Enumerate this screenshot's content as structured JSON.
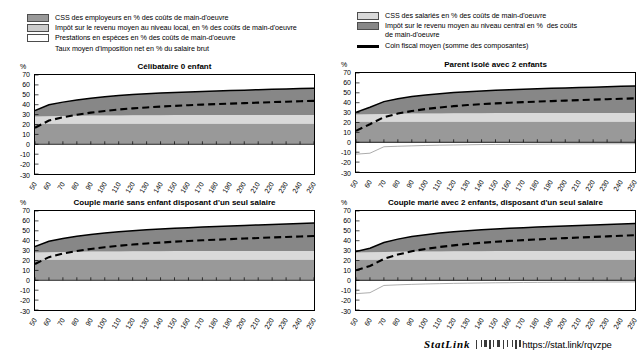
{
  "legend_left": {
    "items": [
      {
        "marker": "swatch",
        "color": "#999999",
        "label": "CSS des employeurs en % des coûts de main-d'oeuvre"
      },
      {
        "marker": "swatch",
        "color": "#cccccc",
        "label": "Impôt sur le revenu moyen au niveau local, en % des coûts de main-d'oeuvre"
      },
      {
        "marker": "swatch",
        "color": "#ffffff",
        "label": "Prestations en espèces en % des coûts de main-d'oeuvre"
      },
      {
        "marker": "dashed-line",
        "color": "#000000",
        "label": "Taux moyen d'imposition net en % du salaire brut"
      }
    ]
  },
  "legend_right": {
    "items": [
      {
        "marker": "swatch",
        "color": "#d9d9d9",
        "label": "CSS des salariés en % des coûts de main-d'oeuvre"
      },
      {
        "marker": "swatch",
        "color": "#878787",
        "label": "Impôt sur le revenu moyen au niveau central en %  des coûts\nde main-d'oeuvre"
      },
      {
        "marker": "solid-line",
        "color": "#000000",
        "label": "Coin fiscal moyen (somme des composantes)"
      }
    ]
  },
  "axis": {
    "y_unit": "%",
    "y_ticks": [
      70,
      60,
      50,
      40,
      30,
      20,
      10,
      0,
      -10,
      -20,
      -30
    ],
    "x_ticks": [
      50,
      60,
      70,
      80,
      90,
      100,
      110,
      120,
      130,
      140,
      150,
      160,
      170,
      180,
      190,
      200,
      210,
      220,
      230,
      240,
      250
    ]
  },
  "footer": {
    "statlink_word": "StatLink",
    "glyph": "barcode-icon",
    "url": "https://stat.link/rqvzpe"
  },
  "chart_data": [
    {
      "id": "celibataire-0-enfant",
      "type": "area",
      "title": "Célibataire 0 enfant",
      "xlabel": "",
      "ylabel": "%",
      "ylim": [
        -30,
        70
      ],
      "xlim": [
        50,
        250
      ],
      "grid": false,
      "legend": "top",
      "x": [
        50,
        60,
        70,
        80,
        90,
        100,
        110,
        120,
        130,
        140,
        150,
        160,
        170,
        180,
        190,
        200,
        210,
        220,
        230,
        240,
        250
      ],
      "series": [
        {
          "name": "CSS des employeurs en % des coûts de main-d'oeuvre",
          "color": "#999999",
          "values": [
            21.0,
            21.0,
            21.0,
            21.0,
            21.0,
            21.0,
            21.0,
            21.0,
            21.0,
            21.0,
            21.0,
            21.0,
            21.0,
            21.0,
            21.0,
            21.0,
            21.0,
            21.0,
            21.0,
            21.0,
            21.0
          ]
        },
        {
          "name": "CSS des salariés en % des coûts de main-d'oeuvre",
          "color": "#d9d9d9",
          "values": [
            7.2,
            7.4,
            7.6,
            7.8,
            8.0,
            8.1,
            8.2,
            8.3,
            8.4,
            8.4,
            8.5,
            8.5,
            8.5,
            8.6,
            8.6,
            8.6,
            8.6,
            8.6,
            8.6,
            8.6,
            8.6
          ]
        },
        {
          "name": "Impôt sur le revenu moyen au niveau local, en % des coûts de main-d'oeuvre",
          "color": "#cccccc",
          "values": [
            0,
            0,
            0,
            0,
            0,
            0,
            0,
            0,
            0,
            0,
            0,
            0,
            0,
            0,
            0,
            0,
            0,
            0,
            0,
            0,
            0
          ]
        },
        {
          "name": "Impôt sur le revenu moyen au niveau central en % des coûts de main-d'oeuvre",
          "color": "#878787",
          "values": [
            6.0,
            11.5,
            14.0,
            16.0,
            17.6,
            18.9,
            20.0,
            20.9,
            21.6,
            22.3,
            22.9,
            23.4,
            23.9,
            24.3,
            24.7,
            25.1,
            25.5,
            25.9,
            26.3,
            26.7,
            27.1
          ]
        },
        {
          "name": "Prestations en espèces en % des coûts de main-d'oeuvre",
          "color": "#ffffff",
          "values": [
            0,
            0,
            0,
            0,
            0,
            0,
            0,
            0,
            0,
            0,
            0,
            0,
            0,
            0,
            0,
            0,
            0,
            0,
            0,
            0,
            0
          ]
        }
      ],
      "lines": [
        {
          "name": "Coin fiscal moyen (somme des composantes)",
          "style": "solid",
          "color": "#000000",
          "values": [
            34.2,
            39.9,
            42.6,
            44.8,
            46.6,
            48.0,
            49.2,
            50.2,
            51.0,
            51.7,
            52.4,
            52.9,
            53.4,
            53.9,
            54.3,
            54.7,
            55.1,
            55.5,
            55.9,
            56.3,
            56.7
          ]
        },
        {
          "name": "Taux moyen d'imposition net en % du salaire brut",
          "style": "dashed",
          "color": "#000000",
          "values": [
            16.7,
            24.0,
            27.3,
            29.9,
            32.0,
            33.7,
            35.1,
            36.3,
            37.2,
            38.1,
            38.8,
            39.5,
            40.1,
            40.6,
            41.1,
            41.6,
            42.1,
            42.6,
            43.0,
            43.5,
            43.9
          ]
        }
      ]
    },
    {
      "id": "parent-isole-2-enfants",
      "type": "area",
      "title": "Parent isolé avec 2 enfants",
      "xlabel": "",
      "ylabel": "%",
      "ylim": [
        -30,
        70
      ],
      "xlim": [
        50,
        250
      ],
      "grid": false,
      "legend": "top",
      "x": [
        50,
        60,
        70,
        80,
        90,
        100,
        110,
        120,
        130,
        140,
        150,
        160,
        170,
        180,
        190,
        200,
        210,
        220,
        230,
        240,
        250
      ],
      "series": [
        {
          "name": "CSS des employeurs en % des coûts de main-d'oeuvre",
          "color": "#999999",
          "values": [
            21.0,
            21.0,
            21.0,
            21.0,
            21.0,
            21.0,
            21.0,
            21.0,
            21.0,
            21.0,
            21.0,
            21.0,
            21.0,
            21.0,
            21.0,
            21.0,
            21.0,
            21.0,
            21.0,
            21.0,
            21.0
          ]
        },
        {
          "name": "CSS des salariés en % des coûts de main-d'oeuvre",
          "color": "#d9d9d9",
          "values": [
            7.2,
            7.4,
            7.6,
            7.8,
            8.0,
            8.1,
            8.2,
            8.3,
            8.4,
            8.4,
            8.5,
            8.5,
            8.5,
            8.6,
            8.6,
            8.6,
            8.6,
            8.6,
            8.6,
            8.6,
            8.6
          ]
        },
        {
          "name": "Impôt sur le revenu moyen au niveau local, en % des coûts de main-d'oeuvre",
          "color": "#cccccc",
          "values": [
            0,
            0,
            0,
            0,
            0,
            0,
            0,
            0,
            0,
            0,
            0,
            0,
            0,
            0,
            0,
            0,
            0,
            0,
            0,
            0,
            0
          ]
        },
        {
          "name": "Impôt sur le revenu moyen au niveau central en % des coûts de main-d'oeuvre",
          "color": "#878787",
          "values": [
            2.0,
            7.0,
            12.5,
            15.2,
            17.2,
            18.7,
            19.9,
            20.9,
            21.7,
            22.4,
            23.0,
            23.6,
            24.1,
            24.5,
            24.9,
            25.3,
            25.7,
            26.1,
            26.5,
            26.9,
            27.3
          ]
        },
        {
          "name": "Prestations en espèces en % des coûts de main-d'oeuvre",
          "color": "#ffffff",
          "values": [
            -12.0,
            -11.0,
            -4.5,
            -4.0,
            -3.6,
            -3.2,
            -2.9,
            -2.7,
            -2.5,
            -2.3,
            -2.2,
            -2.1,
            -2.0,
            -1.9,
            -1.8,
            -1.7,
            -1.6,
            -1.6,
            -1.5,
            -1.5,
            -1.4
          ]
        }
      ],
      "lines": [
        {
          "name": "Coin fiscal moyen (somme des composantes)",
          "style": "solid",
          "color": "#000000",
          "values": [
            30.2,
            35.4,
            41.1,
            44.0,
            46.2,
            47.8,
            49.1,
            50.2,
            51.1,
            51.8,
            52.5,
            53.1,
            53.6,
            54.1,
            54.5,
            54.9,
            55.3,
            55.7,
            56.1,
            56.5,
            56.9
          ]
        },
        {
          "name": "Taux moyen d'imposition net en % du salaire brut",
          "style": "dashed",
          "color": "#000000",
          "values": [
            11.6,
            18.3,
            25.4,
            29.0,
            31.6,
            33.6,
            35.2,
            36.5,
            37.6,
            38.5,
            39.3,
            40.0,
            40.6,
            41.1,
            41.6,
            42.1,
            42.6,
            43.1,
            43.5,
            44.0,
            44.4
          ]
        }
      ]
    },
    {
      "id": "couple-marie-sans-enfant",
      "type": "area",
      "title": "Couple marié sans enfant disposant d'un seul salaire",
      "xlabel": "",
      "ylabel": "%",
      "ylim": [
        -30,
        70
      ],
      "xlim": [
        50,
        250
      ],
      "grid": false,
      "legend": "top",
      "x": [
        50,
        60,
        70,
        80,
        90,
        100,
        110,
        120,
        130,
        140,
        150,
        160,
        170,
        180,
        190,
        200,
        210,
        220,
        230,
        240,
        250
      ],
      "series": [
        {
          "name": "CSS des employeurs en % des coûts de main-d'oeuvre",
          "color": "#999999",
          "values": [
            21.0,
            21.0,
            21.0,
            21.0,
            21.0,
            21.0,
            21.0,
            21.0,
            21.0,
            21.0,
            21.0,
            21.0,
            21.0,
            21.0,
            21.0,
            21.0,
            21.0,
            21.0,
            21.0,
            21.0,
            21.0
          ]
        },
        {
          "name": "CSS des salariés en % des coûts de main-d'oeuvre",
          "color": "#d9d9d9",
          "values": [
            7.2,
            7.4,
            7.6,
            7.8,
            8.0,
            8.1,
            8.2,
            8.3,
            8.4,
            8.4,
            8.5,
            8.5,
            8.5,
            8.6,
            8.6,
            8.6,
            8.6,
            8.6,
            8.6,
            8.6,
            8.6
          ]
        },
        {
          "name": "Impôt sur le revenu moyen au niveau local, en % des coûts de main-d'oeuvre",
          "color": "#cccccc",
          "values": [
            0,
            0,
            0,
            0,
            0,
            0,
            0,
            0,
            0,
            0,
            0,
            0,
            0,
            0,
            0,
            0,
            0,
            0,
            0,
            0,
            0
          ]
        },
        {
          "name": "Impôt sur le revenu moyen au niveau central en % des coûts de main-d'oeuvre",
          "color": "#878787",
          "values": [
            5.8,
            11.0,
            13.6,
            15.6,
            17.2,
            18.6,
            19.8,
            20.8,
            21.6,
            22.4,
            23.1,
            23.7,
            24.3,
            24.8,
            25.3,
            25.8,
            26.3,
            26.8,
            27.3,
            27.8,
            28.3
          ]
        },
        {
          "name": "Prestations en espèces en % des coûts de main-d'oeuvre",
          "color": "#ffffff",
          "values": [
            0,
            0,
            0,
            0,
            0,
            0,
            0,
            0,
            0,
            0,
            0,
            0,
            0,
            0,
            0,
            0,
            0,
            0,
            0,
            0,
            0
          ]
        }
      ],
      "lines": [
        {
          "name": "Coin fiscal moyen (somme des composantes)",
          "style": "solid",
          "color": "#000000",
          "values": [
            34.0,
            39.4,
            42.2,
            44.4,
            46.2,
            47.7,
            49.0,
            50.1,
            51.0,
            51.8,
            52.6,
            53.2,
            53.8,
            54.4,
            54.9,
            55.4,
            55.9,
            56.4,
            56.9,
            57.4,
            57.9
          ]
        },
        {
          "name": "Taux moyen d'imposition net en % du salaire brut",
          "style": "dashed",
          "color": "#000000",
          "values": [
            16.5,
            23.4,
            27.0,
            29.6,
            31.7,
            33.4,
            34.9,
            36.1,
            37.2,
            38.1,
            39.0,
            39.7,
            40.4,
            41.0,
            41.6,
            42.2,
            42.7,
            43.3,
            43.8,
            44.3,
            44.8
          ]
        }
      ]
    },
    {
      "id": "couple-marie-2-enfants",
      "type": "area",
      "title": "Couple marié avec 2 enfants, disposant d'un seul salaire",
      "xlabel": "",
      "ylabel": "%",
      "ylim": [
        -30,
        70
      ],
      "xlim": [
        50,
        250
      ],
      "grid": false,
      "legend": "top",
      "x": [
        50,
        60,
        70,
        80,
        90,
        100,
        110,
        120,
        130,
        140,
        150,
        160,
        170,
        180,
        190,
        200,
        210,
        220,
        230,
        240,
        250
      ],
      "series": [
        {
          "name": "CSS des employeurs en % des coûts de main-d'oeuvre",
          "color": "#999999",
          "values": [
            21.0,
            21.0,
            21.0,
            21.0,
            21.0,
            21.0,
            21.0,
            21.0,
            21.0,
            21.0,
            21.0,
            21.0,
            21.0,
            21.0,
            21.0,
            21.0,
            21.0,
            21.0,
            21.0,
            21.0,
            21.0
          ]
        },
        {
          "name": "CSS des salariés en % des coûts de main-d'oeuvre",
          "color": "#d9d9d9",
          "values": [
            7.2,
            7.4,
            7.6,
            7.8,
            8.0,
            8.1,
            8.2,
            8.3,
            8.4,
            8.4,
            8.5,
            8.5,
            8.5,
            8.6,
            8.6,
            8.6,
            8.6,
            8.6,
            8.6,
            8.6,
            8.6
          ]
        },
        {
          "name": "Impôt sur le revenu moyen au niveau local, en % des coûts de main-d'oeuvre",
          "color": "#cccccc",
          "values": [
            0,
            0,
            0,
            0,
            0,
            0,
            0,
            0,
            0,
            0,
            0,
            0,
            0,
            0,
            0,
            0,
            0,
            0,
            0,
            0,
            0
          ]
        },
        {
          "name": "Impôt sur le revenu moyen au niveau central en % des coûts de main-d'oeuvre",
          "color": "#878787",
          "values": [
            0.8,
            4.0,
            9.5,
            12.8,
            15.2,
            17.0,
            18.5,
            19.7,
            20.7,
            21.6,
            22.4,
            23.1,
            23.7,
            24.3,
            24.8,
            25.3,
            25.8,
            26.3,
            26.8,
            27.3,
            27.8
          ]
        },
        {
          "name": "Prestations en espèces en % des coûts de main-d'oeuvre",
          "color": "#ffffff",
          "values": [
            -13.5,
            -12.5,
            -5.2,
            -4.6,
            -4.1,
            -3.7,
            -3.4,
            -3.1,
            -2.9,
            -2.7,
            -2.5,
            -2.4,
            -2.2,
            -2.1,
            -2.0,
            -1.9,
            -1.9,
            -1.8,
            -1.7,
            -1.7,
            -1.6
          ]
        }
      ],
      "lines": [
        {
          "name": "Coin fiscal moyen (somme des composantes)",
          "style": "solid",
          "color": "#000000",
          "values": [
            29.0,
            32.4,
            38.1,
            41.6,
            44.2,
            46.1,
            47.7,
            49.0,
            50.1,
            51.0,
            51.9,
            52.6,
            53.2,
            53.9,
            54.4,
            54.9,
            55.4,
            55.9,
            56.4,
            56.9,
            57.4
          ]
        },
        {
          "name": "Taux moyen d'imposition net en % du salaire brut",
          "style": "dashed",
          "color": "#000000",
          "values": [
            10.1,
            14.4,
            21.6,
            26.0,
            29.3,
            31.7,
            33.7,
            35.3,
            36.7,
            37.9,
            38.9,
            39.8,
            40.6,
            41.3,
            42.0,
            42.6,
            43.2,
            43.8,
            44.4,
            45.0,
            45.5
          ]
        }
      ]
    }
  ]
}
